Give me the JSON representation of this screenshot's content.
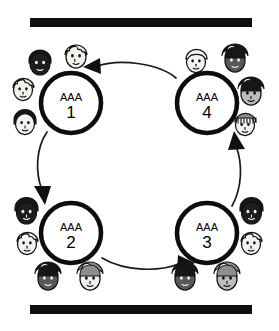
{
  "diagram": {
    "style": {
      "background": "#ffffff",
      "ink": "#0d0d0d",
      "bar_color": "#100f0f",
      "edge_color": "#1a1a1a"
    },
    "bars": [
      {
        "id": "top-bar",
        "label": "top rule",
        "color": "#100f0f"
      },
      {
        "id": "bottom-bar",
        "label": "bottom rule",
        "color": "#100f0f"
      }
    ],
    "nodes": [
      {
        "id": "node-1",
        "code": "AAA",
        "number": "1",
        "position": "top-left",
        "cx": 71,
        "cy": 103,
        "r": 30
      },
      {
        "id": "node-2",
        "code": "AAA",
        "number": "2",
        "position": "bottom-left",
        "cx": 71,
        "cy": 233,
        "r": 30
      },
      {
        "id": "node-3",
        "code": "AAA",
        "number": "3",
        "position": "bottom-right",
        "cx": 207,
        "cy": 233,
        "r": 30
      },
      {
        "id": "node-4",
        "code": "AAA",
        "number": "4",
        "position": "top-right",
        "cx": 207,
        "cy": 103,
        "r": 30
      }
    ],
    "edges": [
      {
        "id": "edge-1-2",
        "from": "1",
        "to": "2",
        "side": "left",
        "direction": "down"
      },
      {
        "id": "edge-2-3",
        "from": "2",
        "to": "3",
        "side": "bottom",
        "direction": "right"
      },
      {
        "id": "edge-3-4",
        "from": "3",
        "to": "4",
        "side": "right",
        "direction": "up"
      },
      {
        "id": "edge-4-1",
        "from": "4",
        "to": "1",
        "side": "top",
        "direction": "left"
      }
    ],
    "cycle_direction": "clockwise",
    "person_groups": [
      {
        "node": "node-1",
        "count": 4,
        "people": [
          {
            "id": "p1-a",
            "skin": "dark",
            "hair": "dark",
            "placement": "above-left"
          },
          {
            "id": "p1-b",
            "skin": "light",
            "hair": "light",
            "placement": "above-right"
          },
          {
            "id": "p1-c",
            "skin": "light",
            "hair": "light",
            "placement": "left-upper"
          },
          {
            "id": "p1-d",
            "skin": "light",
            "hair": "dark",
            "placement": "left-lower"
          }
        ]
      },
      {
        "node": "node-2",
        "count": 4,
        "people": [
          {
            "id": "p2-a",
            "skin": "vdark",
            "hair": "dark",
            "placement": "left-upper"
          },
          {
            "id": "p2-b",
            "skin": "light",
            "hair": "light",
            "placement": "left-lower"
          },
          {
            "id": "p2-c",
            "skin": "dark",
            "hair": "dark",
            "placement": "below-left"
          },
          {
            "id": "p2-d",
            "skin": "light",
            "hair": "mid",
            "placement": "below-right"
          }
        ]
      },
      {
        "node": "node-3",
        "count": 4,
        "people": [
          {
            "id": "p3-a",
            "skin": "vdark",
            "hair": "dark",
            "placement": "right-upper"
          },
          {
            "id": "p3-b",
            "skin": "light",
            "hair": "light",
            "placement": "right-lower"
          },
          {
            "id": "p3-c",
            "skin": "dark",
            "hair": "dark",
            "placement": "below-left"
          },
          {
            "id": "p3-d",
            "skin": "mid",
            "hair": "mid",
            "placement": "below-right"
          }
        ]
      },
      {
        "node": "node-4",
        "count": 4,
        "people": [
          {
            "id": "p4-a",
            "skin": "light",
            "hair": "light",
            "placement": "above-left"
          },
          {
            "id": "p4-b",
            "skin": "dark",
            "hair": "dark",
            "placement": "above-right"
          },
          {
            "id": "p4-c",
            "skin": "mid",
            "hair": "dark",
            "placement": "right-upper"
          },
          {
            "id": "p4-d",
            "skin": "light",
            "hair": "mid",
            "placement": "right-lower"
          }
        ]
      }
    ]
  }
}
